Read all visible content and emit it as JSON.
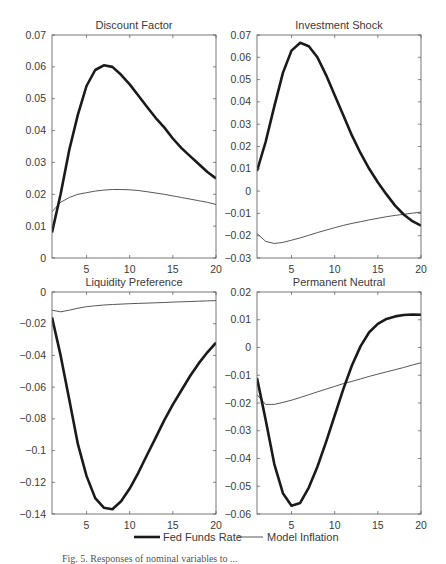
{
  "figure": {
    "legend": {
      "items": [
        {
          "label": "Fed Funds Rate",
          "style": "thick",
          "color": "#1a1a1a"
        },
        {
          "label": "Model Inflation",
          "style": "thin",
          "color": "#444444"
        }
      ]
    },
    "caption_partial": "Fig. 5. Responses of nominal variables to ..."
  },
  "chart_data": [
    {
      "type": "line",
      "title": "Discount Factor",
      "xlabel": "",
      "ylabel": "",
      "xlim": [
        1,
        20
      ],
      "ylim": [
        0,
        0.07
      ],
      "xticks": [
        5,
        10,
        15,
        20
      ],
      "yticks": [
        0,
        0.01,
        0.02,
        0.03,
        0.04,
        0.05,
        0.06,
        0.07
      ],
      "ytick_labels": [
        "0",
        "0.01",
        "0.02",
        "0.03",
        "0.04",
        "0.05",
        "0.06",
        "0.07"
      ],
      "grid": false,
      "x": [
        1,
        2,
        3,
        4,
        5,
        6,
        7,
        8,
        9,
        10,
        11,
        12,
        13,
        14,
        15,
        16,
        17,
        18,
        19,
        20
      ],
      "series": [
        {
          "name": "Fed Funds Rate",
          "values": [
            0.008,
            0.02,
            0.034,
            0.045,
            0.054,
            0.059,
            0.0605,
            0.06,
            0.0575,
            0.0545,
            0.051,
            0.0475,
            0.044,
            0.041,
            0.0375,
            0.0345,
            0.032,
            0.0295,
            0.027,
            0.025
          ]
        },
        {
          "name": "Model Inflation",
          "values": [
            0.0145,
            0.0175,
            0.019,
            0.02,
            0.0205,
            0.021,
            0.0213,
            0.0215,
            0.0215,
            0.0214,
            0.0212,
            0.0208,
            0.0204,
            0.02,
            0.0195,
            0.019,
            0.0185,
            0.018,
            0.0175,
            0.0168
          ]
        }
      ]
    },
    {
      "type": "line",
      "title": "Investment Shock",
      "xlabel": "",
      "ylabel": "",
      "xlim": [
        1,
        20
      ],
      "ylim": [
        -0.03,
        0.07
      ],
      "xticks": [
        5,
        10,
        15,
        20
      ],
      "yticks": [
        -0.03,
        -0.02,
        -0.01,
        0,
        0.01,
        0.02,
        0.03,
        0.04,
        0.05,
        0.06,
        0.07
      ],
      "ytick_labels": [
        "−0.03",
        "−0.02",
        "−0.01",
        "0",
        "0.01",
        "0.02",
        "0.03",
        "0.04",
        "0.05",
        "0.06",
        "0.07"
      ],
      "grid": false,
      "x": [
        1,
        2,
        3,
        4,
        5,
        6,
        7,
        8,
        9,
        10,
        11,
        12,
        13,
        14,
        15,
        16,
        17,
        18,
        19,
        20
      ],
      "series": [
        {
          "name": "Fed Funds Rate",
          "values": [
            0.009,
            0.022,
            0.038,
            0.053,
            0.063,
            0.0665,
            0.065,
            0.06,
            0.052,
            0.043,
            0.034,
            0.025,
            0.017,
            0.01,
            0.004,
            -0.0015,
            -0.0065,
            -0.0105,
            -0.0135,
            -0.0155
          ]
        },
        {
          "name": "Model Inflation",
          "values": [
            -0.019,
            -0.0225,
            -0.0235,
            -0.023,
            -0.022,
            -0.021,
            -0.0198,
            -0.0186,
            -0.0175,
            -0.0164,
            -0.0154,
            -0.0145,
            -0.0137,
            -0.0129,
            -0.0122,
            -0.0115,
            -0.0109,
            -0.0104,
            -0.0099,
            -0.0094
          ]
        }
      ]
    },
    {
      "type": "line",
      "title": "Liquidity Preference",
      "xlabel": "",
      "ylabel": "",
      "xlim": [
        1,
        20
      ],
      "ylim": [
        -0.14,
        0
      ],
      "xticks": [
        5,
        10,
        15,
        20
      ],
      "yticks": [
        -0.14,
        -0.12,
        -0.1,
        -0.08,
        -0.06,
        -0.04,
        -0.02,
        0
      ],
      "ytick_labels": [
        "−0.14",
        "−0.12",
        "−0.1",
        "−0.08",
        "−0.06",
        "−0.04",
        "−0.02",
        "0"
      ],
      "grid": false,
      "x": [
        1,
        2,
        3,
        4,
        5,
        6,
        7,
        8,
        9,
        10,
        11,
        12,
        13,
        14,
        15,
        16,
        17,
        18,
        19,
        20
      ],
      "series": [
        {
          "name": "Fed Funds Rate",
          "values": [
            -0.016,
            -0.04,
            -0.068,
            -0.096,
            -0.116,
            -0.13,
            -0.136,
            -0.137,
            -0.132,
            -0.124,
            -0.114,
            -0.103,
            -0.092,
            -0.081,
            -0.071,
            -0.062,
            -0.053,
            -0.045,
            -0.038,
            -0.032
          ]
        },
        {
          "name": "Model Inflation",
          "values": [
            -0.0115,
            -0.0125,
            -0.0115,
            -0.0102,
            -0.0093,
            -0.0087,
            -0.0082,
            -0.0079,
            -0.0076,
            -0.0074,
            -0.0072,
            -0.007,
            -0.0068,
            -0.0066,
            -0.0064,
            -0.0062,
            -0.006,
            -0.0058,
            -0.0056,
            -0.0054
          ]
        }
      ]
    },
    {
      "type": "line",
      "title": "Permanent Neutral",
      "xlabel": "",
      "ylabel": "",
      "xlim": [
        1,
        20
      ],
      "ylim": [
        -0.06,
        0.02
      ],
      "xticks": [
        5,
        10,
        15,
        20
      ],
      "yticks": [
        -0.06,
        -0.05,
        -0.04,
        -0.03,
        -0.02,
        -0.01,
        0,
        0.01,
        0.02
      ],
      "ytick_labels": [
        "−0.06",
        "−0.05",
        "−0.04",
        "−0.03",
        "−0.02",
        "−0.01",
        "0",
        "0.01",
        "0.02"
      ],
      "grid": false,
      "x": [
        1,
        2,
        3,
        4,
        5,
        6,
        7,
        8,
        9,
        10,
        11,
        12,
        13,
        14,
        15,
        16,
        17,
        18,
        19,
        20
      ],
      "series": [
        {
          "name": "Fed Funds Rate",
          "values": [
            -0.011,
            -0.026,
            -0.042,
            -0.0525,
            -0.057,
            -0.056,
            -0.0505,
            -0.043,
            -0.034,
            -0.0245,
            -0.015,
            -0.0065,
            0.0005,
            0.0055,
            0.0085,
            0.0103,
            0.0112,
            0.0117,
            0.0119,
            0.0118
          ]
        },
        {
          "name": "Model Inflation",
          "values": [
            -0.017,
            -0.0205,
            -0.0205,
            -0.0198,
            -0.019,
            -0.018,
            -0.017,
            -0.016,
            -0.015,
            -0.014,
            -0.013,
            -0.0122,
            -0.0113,
            -0.0104,
            -0.0096,
            -0.0088,
            -0.008,
            -0.0072,
            -0.0063,
            -0.0055
          ]
        }
      ]
    }
  ]
}
